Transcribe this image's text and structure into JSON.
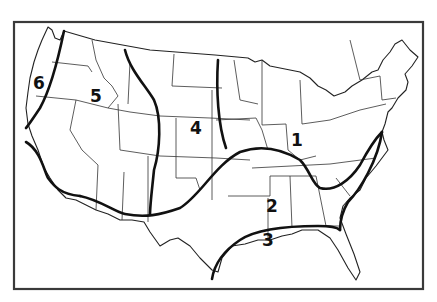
{
  "map": {
    "subject": "United States (contiguous) divided into numbered zones",
    "colors": {
      "background": "#ffffff",
      "lines": "#111111",
      "frame": "#3a3a3a"
    },
    "zones": [
      {
        "id": 1,
        "label": "1",
        "x": 291,
        "y": 132
      },
      {
        "id": 2,
        "label": "2",
        "x": 266,
        "y": 198
      },
      {
        "id": 3,
        "label": "3",
        "x": 262,
        "y": 232
      },
      {
        "id": 4,
        "label": "4",
        "x": 190,
        "y": 120
      },
      {
        "id": 5,
        "label": "5",
        "x": 90,
        "y": 88
      },
      {
        "id": 6,
        "label": "6",
        "x": 33,
        "y": 75
      }
    ]
  }
}
